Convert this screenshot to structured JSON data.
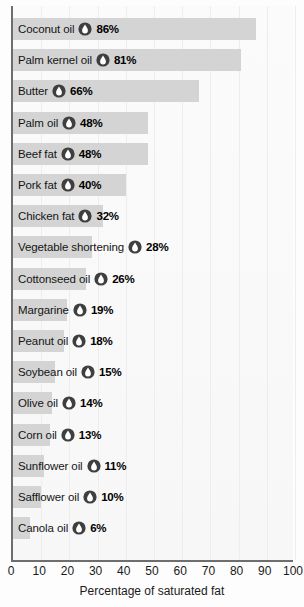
{
  "chart_data": {
    "type": "bar",
    "orientation": "horizontal",
    "title": "",
    "xlabel": "Percentage of saturated fat",
    "ylabel": "",
    "xlim": [
      0,
      100
    ],
    "xticks": [
      0,
      10,
      20,
      30,
      40,
      50,
      60,
      70,
      80,
      90,
      100
    ],
    "grid": true,
    "grid_axis": "x",
    "legend": false,
    "value_suffix": "%",
    "categories": [
      "Coconut oil",
      "Palm kernel oil",
      "Butter",
      "Palm oil",
      "Beef fat",
      "Pork fat",
      "Chicken fat",
      "Vegetable shortening",
      "Cottonseed oil",
      "Margarine",
      "Peanut oil",
      "Soybean oil",
      "Olive oil",
      "Corn oil",
      "Sunflower oil",
      "Safflower oil",
      "Canola oil"
    ],
    "values": [
      86,
      81,
      66,
      48,
      48,
      40,
      32,
      28,
      26,
      19,
      18,
      15,
      14,
      13,
      11,
      10,
      6
    ],
    "value_labels": [
      "86%",
      "81%",
      "66%",
      "48%",
      "48%",
      "40%",
      "32%",
      "28%",
      "26%",
      "19%",
      "18%",
      "15%",
      "14%",
      "13%",
      "11%",
      "10%",
      "6%"
    ],
    "bars": [
      {
        "category": "Coconut oil",
        "value": 86,
        "label": "86%"
      },
      {
        "category": "Palm kernel oil",
        "value": 81,
        "label": "81%"
      },
      {
        "category": "Butter",
        "value": 66,
        "label": "66%"
      },
      {
        "category": "Palm oil",
        "value": 48,
        "label": "48%"
      },
      {
        "category": "Beef fat",
        "value": 48,
        "label": "48%"
      },
      {
        "category": "Pork fat",
        "value": 40,
        "label": "40%"
      },
      {
        "category": "Chicken fat",
        "value": 32,
        "label": "32%"
      },
      {
        "category": "Vegetable shortening",
        "value": 28,
        "label": "28%"
      },
      {
        "category": "Cottonseed oil",
        "value": 26,
        "label": "26%"
      },
      {
        "category": "Margarine",
        "value": 19,
        "label": "19%"
      },
      {
        "category": "Peanut oil",
        "value": 18,
        "label": "18%"
      },
      {
        "category": "Soybean oil",
        "value": 15,
        "label": "15%"
      },
      {
        "category": "Olive oil",
        "value": 14,
        "label": "14%"
      },
      {
        "category": "Corn oil",
        "value": 13,
        "label": "13%"
      },
      {
        "category": "Sunflower oil",
        "value": 11,
        "label": "11%"
      },
      {
        "category": "Safflower oil",
        "value": 10,
        "label": "10%"
      },
      {
        "category": "Canola oil",
        "value": 6,
        "label": "6%"
      }
    ],
    "icon": "oil-drop-icon",
    "colors": {
      "bar_fill": "#d4d4d4",
      "plot_background": "#fafafa",
      "gridline": "#ededed",
      "axis_line": "#6e6e6e",
      "icon_circle": "#3f3f3f",
      "icon_drop": "#ffffff",
      "text": "#151515"
    }
  }
}
